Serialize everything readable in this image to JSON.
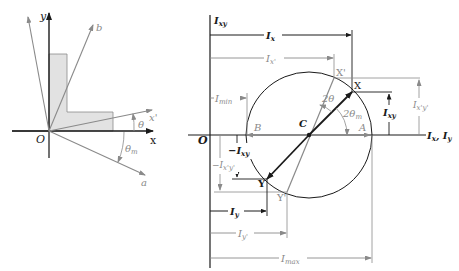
{
  "colors": {
    "primary": "#1a1a1a",
    "secondary": "#8a8a8a",
    "shading": "#e2e2e2",
    "background": "#ffffff"
  },
  "left_figure": {
    "origin_label": "O",
    "x_axis_label": "x",
    "y_axis_label": "y",
    "rotated_x_label": "x'",
    "rotated_y_label": "y'",
    "principal_a_label": "a",
    "principal_b_label": "b",
    "theta_label": "θ",
    "theta_m_label": "θ",
    "theta_m_sub": "m",
    "shape": "L-shaped cross-section (shaded)"
  },
  "mohr_circle": {
    "vertical_axis_label": "I",
    "vertical_axis_sub": "xy",
    "horizontal_axis_label": "I",
    "horizontal_axis_sub1": "x",
    "horizontal_axis_sep": ", ",
    "horizontal_axis_label2": "I",
    "horizontal_axis_sub2": "y",
    "origin_label": "O",
    "center_label": "C",
    "point_A": "A",
    "point_B": "B",
    "point_X": "X",
    "point_Y": "Y",
    "point_X_prime": "X'",
    "point_Y_prime": "Y'",
    "angle_2theta": "2θ",
    "angle_2theta_m": "2θ",
    "angle_2theta_m_sub": "m",
    "dimensions": {
      "Ix": {
        "main": "I",
        "sub": "x"
      },
      "Ix_prime": {
        "main": "I",
        "sub": "x'"
      },
      "Imin": {
        "main": "I",
        "sub": "min"
      },
      "Ixy": {
        "main": "I",
        "sub": "xy"
      },
      "neg_Ixy": {
        "main": "−I",
        "sub": "xy"
      },
      "Ixpyp": {
        "main": "I",
        "sub": "x'y'"
      },
      "neg_Ixpyp": {
        "main": "−I",
        "sub": "x'y'"
      },
      "Iy": {
        "main": "I",
        "sub": "y"
      },
      "Iy_prime": {
        "main": "I",
        "sub": "y'"
      },
      "Imax": {
        "main": "I",
        "sub": "max"
      }
    }
  }
}
